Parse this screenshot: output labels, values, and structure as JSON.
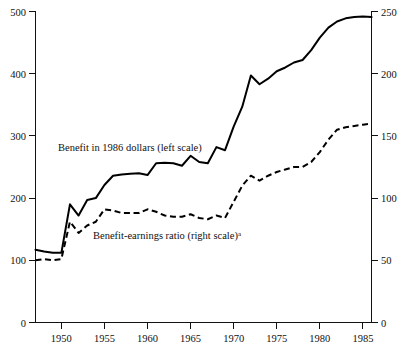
{
  "chart_data": {
    "type": "line",
    "title": "",
    "subtitle": "",
    "xlabel": "",
    "ylabel": "",
    "grid": false,
    "legend_position": "inline-annotation",
    "x": [
      1947,
      1948,
      1949,
      1950,
      1951,
      1952,
      1953,
      1954,
      1955,
      1956,
      1957,
      1958,
      1959,
      1960,
      1961,
      1962,
      1963,
      1964,
      1965,
      1966,
      1967,
      1968,
      1969,
      1970,
      1971,
      1972,
      1973,
      1974,
      1975,
      1976,
      1977,
      1978,
      1979,
      1980,
      1981,
      1982,
      1983,
      1984,
      1985,
      1986
    ],
    "xlim": [
      1947,
      1986
    ],
    "xticks": [
      1950,
      1955,
      1960,
      1965,
      1970,
      1975,
      1980,
      1985
    ],
    "xticklabels": [
      "1950",
      "1955",
      "1960",
      "1965",
      "1970",
      "1975",
      "1980",
      "1985"
    ],
    "left_axis": {
      "label": "Benefit in 1986 dollars",
      "ylim": [
        0,
        500
      ],
      "yticks": [
        0,
        100,
        200,
        300,
        400,
        500
      ],
      "yticklabels": [
        "0",
        "100",
        "200",
        "300",
        "400",
        "500"
      ]
    },
    "right_axis": {
      "label": "Benefit-earnings ratio",
      "ylim": [
        0,
        250
      ],
      "yticks": [
        0,
        50,
        100,
        150,
        200,
        250
      ],
      "yticklabels": [
        "0",
        "50",
        "100",
        "150",
        "200",
        "250"
      ]
    },
    "series": [
      {
        "name": "Benefit in 1986 dollars (left scale)",
        "axis": "left",
        "style": "solid",
        "values": [
          117,
          114,
          112,
          112,
          190,
          172,
          197,
          200,
          221,
          236,
          238,
          239,
          240,
          237,
          256,
          257,
          256,
          252,
          268,
          258,
          256,
          282,
          277,
          315,
          347,
          397,
          383,
          392,
          404,
          410,
          418,
          422,
          438,
          458,
          474,
          484,
          489,
          491,
          492,
          491
        ]
      },
      {
        "name": "Benefit-earnings ratio (right scale)",
        "axis": "right",
        "style": "dashed",
        "values": [
          50,
          51,
          50,
          51,
          81,
          72,
          78,
          81,
          91,
          90,
          88,
          88,
          88,
          91,
          89,
          86,
          85,
          85,
          87,
          84,
          83,
          86,
          84,
          97,
          110,
          118,
          114,
          118,
          121,
          123,
          125,
          125,
          129,
          137,
          147,
          155,
          157,
          158,
          159,
          160
        ]
      }
    ],
    "annotations": [
      {
        "id": "left-series-annotation",
        "text": "Benefit in 1986 dollars (left scale)",
        "superscript": "",
        "x_px": 58,
        "y_px": 151
      },
      {
        "id": "right-series-annotation",
        "text": "Benefit-earnings ratio (right scale)",
        "superscript": "a",
        "x_px": 93,
        "y_px": 239
      }
    ],
    "colors": {
      "ink": "#111111",
      "series_line": "#000000",
      "background": "#ffffff"
    }
  }
}
